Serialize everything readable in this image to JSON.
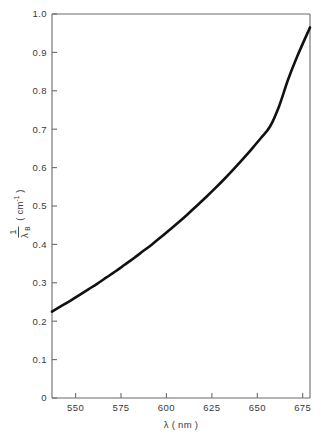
{
  "figure": {
    "background_color": "#ffffff",
    "frame_color": "#6b6b6b",
    "curve_color": "#111111",
    "text_color": "#3a3a3a"
  },
  "chart_data": {
    "type": "line",
    "title": "",
    "subtitle": "",
    "xlabel": "λ ( nm )",
    "ylabel": "1/λ_B ( cm⁻¹ )",
    "ylabel_parts": {
      "numerator": "1",
      "denominator_symbol": "λ",
      "denominator_subscript": "B",
      "unit_open": "( cm",
      "unit_exponent": "-1",
      "unit_close": " )"
    },
    "xlim": [
      537,
      679
    ],
    "ylim": [
      0,
      1.0
    ],
    "xticks": [
      550,
      575,
      600,
      625,
      650,
      675
    ],
    "xticklabels": [
      "550",
      "575",
      "600",
      "625",
      "650",
      "675"
    ],
    "yticks": [
      0,
      0.1,
      0.2,
      0.3,
      0.4,
      0.5,
      0.6,
      0.7,
      0.8,
      0.9,
      1.0
    ],
    "yticklabels": [
      "0",
      "0.1",
      "0.2",
      "0.3",
      "0.4",
      "0.5",
      "0.6",
      "0.7",
      "0.8",
      "0.9",
      "1.0"
    ],
    "grid": false,
    "legend": null,
    "legend_position": "none",
    "series": [
      {
        "name": "1/λ_B vs λ",
        "line_width": 2.6,
        "color": "#111111",
        "x": [
          537,
          542,
          547,
          552,
          557,
          562,
          567,
          572,
          577,
          582,
          587,
          592,
          597,
          602,
          607,
          612,
          617,
          622,
          627,
          632,
          637,
          642,
          647,
          652,
          657,
          662,
          667,
          672,
          679
        ],
        "y": [
          0.225,
          0.239,
          0.253,
          0.268,
          0.283,
          0.298,
          0.314,
          0.33,
          0.347,
          0.364,
          0.382,
          0.4,
          0.419,
          0.439,
          0.459,
          0.48,
          0.502,
          0.524,
          0.547,
          0.571,
          0.596,
          0.622,
          0.649,
          0.677,
          0.707,
          0.76,
          0.83,
          0.89,
          0.965
        ]
      }
    ],
    "annotations": []
  }
}
